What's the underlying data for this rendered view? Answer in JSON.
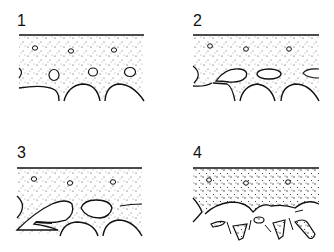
{
  "figure": {
    "panels": [
      {
        "label": "1",
        "description": "Stippled layer with small isolated pores; rounded cavities below"
      },
      {
        "label": "2",
        "description": "Pores enlarge and elongate at base of stippled layer"
      },
      {
        "label": "3",
        "description": "Cavities coalesce into larger openings separated by thin bridges"
      },
      {
        "label": "4",
        "description": "Bridges fracture into fragments below wavy lower boundary"
      }
    ],
    "colors": {
      "ink": "#111111",
      "background": "#ffffff",
      "stipple": "#333333"
    }
  }
}
